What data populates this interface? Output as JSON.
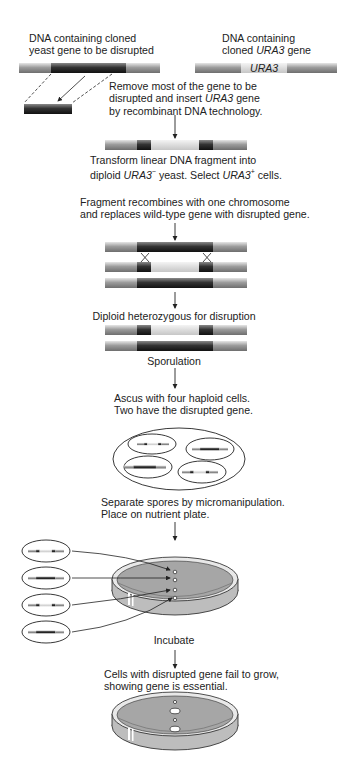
{
  "labels": {
    "left_source_line1": "DNA containing cloned",
    "left_source_line2": "yeast gene to be disrupted",
    "right_source_line1": "DNA containing",
    "right_source_line2_pre": "cloned ",
    "right_source_line2_italic": "URA3",
    "right_source_line2_post": " gene",
    "ura3_bar_label": "URA3",
    "step1_line1": "Remove most of the gene to be",
    "step1_line2_pre": "disrupted and insert ",
    "step1_line2_italic": "URA3",
    "step1_line2_post": " gene",
    "step1_line3": "by recombinant DNA technology.",
    "step2_line1": "Transform linear DNA fragment into",
    "step2_line2_pre": "diploid ",
    "step2_line2_italic1": "URA3",
    "step2_line2_sup1": "−",
    "step2_line2_mid": " yeast. Select ",
    "step2_line2_italic2": "URA3",
    "step2_line2_sup2": "+",
    "step2_line2_post": " cells.",
    "step3_line1": "Fragment recombines with one chromosome",
    "step3_line2": "and replaces wild-type gene with disrupted gene.",
    "step4": "Diploid heterozygous for disruption",
    "step5": "Sporulation",
    "step6_line1": "Ascus with four haploid cells.",
    "step6_line2": "Two have the disrupted gene.",
    "step7_line1": "Separate spores by micromanipulation.",
    "step7_line2": "Place on nutrient plate.",
    "step8": "Incubate",
    "step9_line1": "Cells with disrupted gene fail to grow,",
    "step9_line2": "showing gene is essential."
  },
  "colors": {
    "flank": "#9a9a9a",
    "gene_dark": "#3a3a3a",
    "ura3_light": "#d8d8d8",
    "agar": "#a8a8a8",
    "line": "#222222"
  },
  "ascus_spores": [
    "disrupted",
    "wild-type",
    "wild-type",
    "disrupted"
  ],
  "plate_spores": [
    "disrupted",
    "wild-type",
    "disrupted",
    "wild-type"
  ],
  "final_plate": [
    "no growth",
    "colony",
    "no growth",
    "colony"
  ]
}
